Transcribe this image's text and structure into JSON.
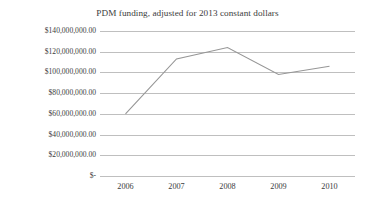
{
  "chart_data": {
    "type": "line",
    "title": "PDM funding, adjusted for 2013 constant dollars",
    "xlabel": "",
    "ylabel": "",
    "categories": [
      "2006",
      "2007",
      "2008",
      "2009",
      "2010"
    ],
    "values": [
      60000000,
      113000000,
      124000000,
      98000000,
      106000000
    ],
    "series": [
      {
        "name": "PDM funding",
        "values": [
          60000000,
          113000000,
          124000000,
          98000000,
          106000000
        ]
      }
    ],
    "ylim": [
      0,
      140000000
    ],
    "ytick_values": [
      0,
      20000000,
      40000000,
      60000000,
      80000000,
      100000000,
      120000000,
      140000000
    ],
    "ytick_labels": [
      "$-",
      "$20,000,000.00",
      "$40,000,000.00",
      "$60,000,000.00",
      "$80,000,000.00",
      "$100,000,000.00",
      "$120,000,000.00",
      "$140,000,000.00"
    ],
    "xtick_labels": [
      "2006",
      "2007",
      "2008",
      "2009",
      "2010"
    ],
    "grid": true,
    "grid_axis": "y",
    "legend": false,
    "legend_position": "none",
    "markers": false,
    "colors": {
      "background": "#ffffff",
      "gridline": "#bfbfbf",
      "series_line": "#969696",
      "text": "#3c3c3c"
    }
  }
}
